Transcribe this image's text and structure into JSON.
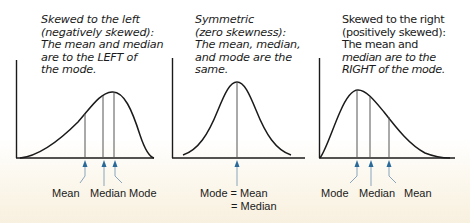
{
  "panels": [
    {
      "id": "left-skewed",
      "caption": [
        "Skewed to the left",
        "(negatively skewed):",
        "The mean and median",
        "are to the LEFT of",
        "the mode."
      ],
      "labels": {
        "first": "Mean",
        "second": "Median",
        "third": "Mode"
      }
    },
    {
      "id": "symmetric",
      "caption": [
        "Symmetric",
        "(zero skewness):",
        "The mean, median,",
        "and mode are the",
        "same."
      ],
      "labels": {
        "line1": "Mode = Mean",
        "line2": "= Median"
      }
    },
    {
      "id": "right-skewed",
      "caption": [
        "Skewed to the right",
        "(positively skewed):",
        "The mean and",
        "median are to the",
        "RIGHT of the mode."
      ],
      "labels": {
        "first": "Mode",
        "second": "Median",
        "third": "Mean"
      }
    }
  ],
  "colors": {
    "axis": "#1a1a1a",
    "curve": "#1a1a1a",
    "marker_line": "#444444",
    "arrow": "#2a6a9a",
    "arrow_line": "#8aa5bb",
    "background_bottom": "#f8f0df"
  }
}
